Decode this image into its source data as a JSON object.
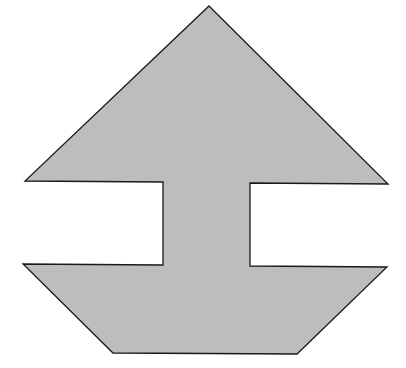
{
  "figure": {
    "fill_color": "#bdbdbd",
    "stroke_color": "#1a1a1a",
    "background": "#ffffff",
    "points": "209,6 388,184 250,183 250,266 387,267 297,354 113,353 23,264 163,265 163,182 25,181"
  }
}
